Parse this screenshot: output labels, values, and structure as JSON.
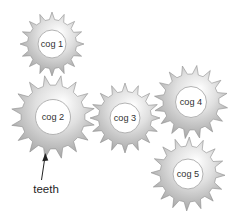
{
  "figure": {
    "background": "#ffffff",
    "gear_colors": {
      "highlight": "#ffffff",
      "light": "#e2e2e2",
      "mid": "#b5b5b5",
      "dark": "#8a8a8a",
      "edge": "#8f8f8f",
      "hole_fill": "#ffffff",
      "hole_stroke": "#b3b3b3"
    },
    "label_color": "#333333",
    "cogs": [
      {
        "label": "cog 1",
        "cx": 52,
        "cy": 44,
        "outer_r": 32,
        "root_r": 24.5,
        "hole_r": 14,
        "teeth": 16,
        "rotation": 0
      },
      {
        "label": "cog 2",
        "cx": 53,
        "cy": 117,
        "outer_r": 42,
        "root_r": 32,
        "hole_r": 17.5,
        "teeth": 16,
        "rotation": 11
      },
      {
        "label": "cog 3",
        "cx": 125,
        "cy": 118,
        "outer_r": 35,
        "root_r": 26.5,
        "hole_r": 15,
        "teeth": 16,
        "rotation": 0
      },
      {
        "label": "cog 4",
        "cx": 191,
        "cy": 102,
        "outer_r": 37,
        "root_r": 28,
        "hole_r": 15.5,
        "teeth": 16,
        "rotation": 9
      },
      {
        "label": "cog 5",
        "cx": 188,
        "cy": 174,
        "outer_r": 37,
        "root_r": 28,
        "hole_r": 15,
        "teeth": 16,
        "rotation": 2
      }
    ],
    "annotation": {
      "label": "teeth",
      "arrow_color": "#222222"
    }
  }
}
